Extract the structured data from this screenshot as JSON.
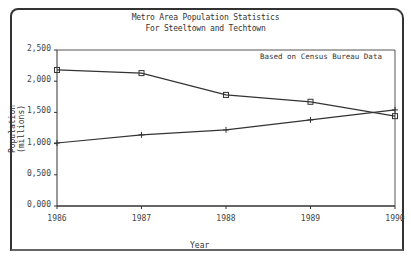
{
  "chart_data": {
    "type": "line",
    "title": "Metro Area Population Statistics",
    "subtitle": "For Steeltown and Techtown",
    "xlabel": "Year",
    "ylabel": "Population (millions)",
    "ylabel_lines": [
      "Population",
      "(millions)"
    ],
    "annotation": "Based on Census Bureau Data",
    "categories": [
      "1986",
      "1987",
      "1988",
      "1989",
      "1990"
    ],
    "yticks": [
      "2.500",
      "2.000",
      "1.500",
      "1.000",
      "0.500",
      "0.000"
    ],
    "ylim": [
      0,
      2.5
    ],
    "grid": false,
    "legend": "none",
    "series": [
      {
        "name": "Steeltown",
        "marker": "square",
        "values": [
          2.18,
          2.13,
          1.78,
          1.67,
          1.44
        ]
      },
      {
        "name": "Techtown",
        "marker": "plus",
        "values": [
          1.01,
          1.14,
          1.22,
          1.38,
          1.54
        ]
      }
    ]
  }
}
